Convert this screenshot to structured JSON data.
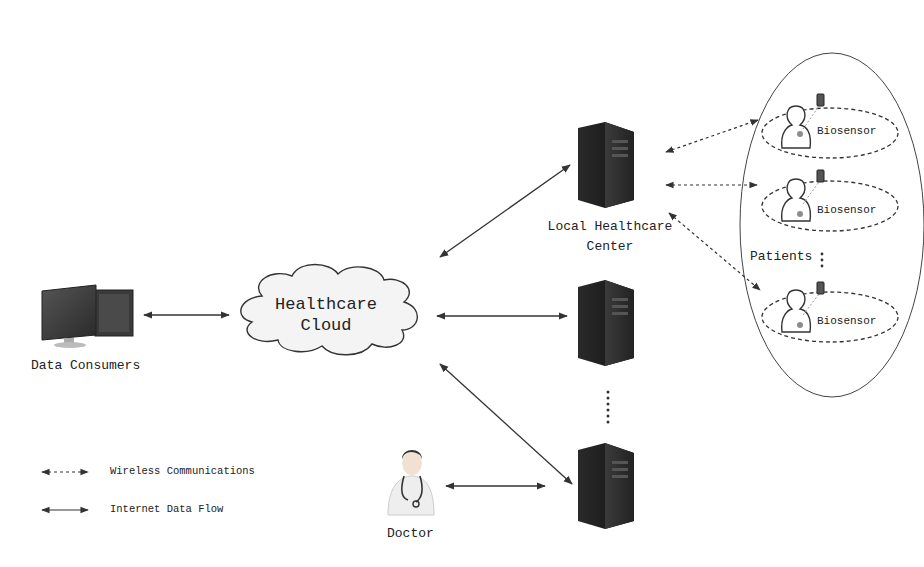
{
  "diagram": {
    "nodes": {
      "data_consumers": {
        "label": "Data Consumers",
        "icon": "desktop-computer-icon"
      },
      "cloud": {
        "label_line1": "Healthcare",
        "label_line2": "Cloud",
        "icon": "cloud-icon"
      },
      "local_center": {
        "label_line1": "Local Healthcare",
        "label_line2": "Center",
        "icon": "server-tower-icon"
      },
      "server_2": {
        "icon": "server-tower-icon"
      },
      "server_3": {
        "icon": "server-tower-icon"
      },
      "doctor": {
        "label": "Doctor",
        "icon": "doctor-icon"
      },
      "patients": {
        "label": "Patients",
        "items": [
          {
            "label": "Biosensor",
            "icon": "patient-icon",
            "device_icon": "biosensor-device-icon"
          },
          {
            "label": "Biosensor",
            "icon": "patient-icon",
            "device_icon": "biosensor-device-icon"
          },
          {
            "label": "Biosensor",
            "icon": "patient-icon",
            "device_icon": "biosensor-device-icon"
          }
        ]
      }
    },
    "edges": [
      {
        "from": "data_consumers",
        "to": "cloud",
        "type": "internet"
      },
      {
        "from": "cloud",
        "to": "local_center",
        "type": "internet"
      },
      {
        "from": "cloud",
        "to": "server_2",
        "type": "internet"
      },
      {
        "from": "cloud",
        "to": "server_3",
        "type": "internet"
      },
      {
        "from": "doctor",
        "to": "server_3",
        "type": "internet"
      },
      {
        "from": "local_center",
        "to": "patient_1",
        "type": "wireless"
      },
      {
        "from": "local_center",
        "to": "patient_2",
        "type": "wireless"
      },
      {
        "from": "local_center",
        "to": "patient_3",
        "type": "wireless"
      }
    ],
    "legend": [
      {
        "label": "Wireless Communications",
        "style": "dashed"
      },
      {
        "label": "Internet Data Flow",
        "style": "solid"
      }
    ],
    "colors": {
      "line": "#333333",
      "server": "#1e1e1e",
      "sensor_dot": "#8c8c8c"
    }
  }
}
